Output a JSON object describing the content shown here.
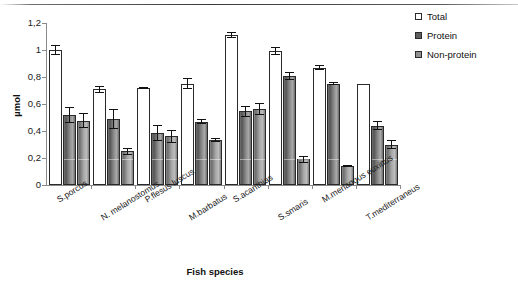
{
  "chart_data": {
    "type": "bar",
    "title": "",
    "xlabel": "Fish species",
    "ylabel": "µmol",
    "ylim": [
      0,
      1.2
    ],
    "ytick_labels": [
      "1,2",
      "1",
      "0,8",
      "0,6",
      "0,4",
      "0,2",
      "0"
    ],
    "ytick_values": [
      1.2,
      1.0,
      0.8,
      0.6,
      0.4,
      0.2,
      0
    ],
    "grid": false,
    "legend_position": "top-right",
    "categories": [
      "S.porcus",
      "N. melanostomus",
      "P.flesus luscus",
      "M.barbatus",
      "S.acanthias",
      "S.smaris",
      "M.merlangus euxinus",
      "T.mediterraneus"
    ],
    "series": [
      {
        "name": "Total",
        "color": "#ffffff",
        "values": [
          1.0,
          0.71,
          0.72,
          0.75,
          1.11,
          0.99,
          0.87,
          0.75
        ],
        "errors": [
          0.035,
          0.025,
          0.008,
          0.04,
          0.02,
          0.03,
          0.02,
          0.0
        ]
      },
      {
        "name": "Protein",
        "color": "#5e5e5e",
        "values": [
          0.52,
          0.49,
          0.385,
          0.47,
          0.545,
          0.81,
          0.75,
          0.44
        ],
        "errors": [
          0.06,
          0.075,
          0.06,
          0.02,
          0.04,
          0.03,
          0.01,
          0.035
        ]
      },
      {
        "name": "Non-protein",
        "color": "#909090",
        "values": [
          0.475,
          0.25,
          0.36,
          0.335,
          0.565,
          0.19,
          0.14,
          0.3
        ],
        "errors": [
          0.055,
          0.025,
          0.05,
          0.015,
          0.045,
          0.025,
          0.01,
          0.035
        ]
      }
    ]
  },
  "legend": {
    "items": [
      {
        "label": "Total",
        "swatch": "sw-total"
      },
      {
        "label": "Protein",
        "swatch": "sw-protein"
      },
      {
        "label": "Non-protein",
        "swatch": "sw-nonprotein"
      }
    ]
  }
}
